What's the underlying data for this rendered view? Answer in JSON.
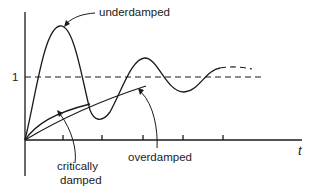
{
  "diagram": {
    "type": "step-response-damping",
    "labels": {
      "underdamped": "underdamped",
      "critically_line1": "critically",
      "critically_line2": "damped",
      "overdamped": "overdamped",
      "x_axis": "t",
      "y_reference": "1"
    },
    "curves": [
      {
        "name": "underdamped",
        "style": "solid then dashed",
        "description": "oscillates about 1 with decaying amplitude"
      },
      {
        "name": "critically damped",
        "style": "solid",
        "description": "rises fastest without overshoot"
      },
      {
        "name": "overdamped",
        "style": "solid",
        "description": "rises slowly without overshoot"
      }
    ],
    "reference_line": {
      "value": "1",
      "style": "dashed"
    },
    "x_ticks_count": 5,
    "colors": {
      "stroke": "#1a1a1a",
      "text": "#222222",
      "background": "#ffffff"
    }
  }
}
